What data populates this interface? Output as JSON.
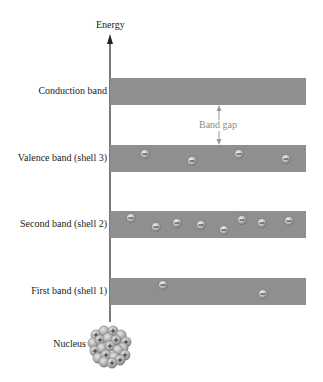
{
  "diagram": {
    "axis_label": "Energy",
    "band_gap_label": "Band gap",
    "nucleus_label": "Nucleus",
    "colors": {
      "band": "#8f8f8f",
      "axis": "#333333",
      "band_gap_arrow": "#9a9a9a",
      "band_gap_text": "#8a8a8a",
      "electron": "#b5b5b5",
      "nucleus": "#a9a9a9"
    },
    "bands": [
      {
        "name": "Conduction band",
        "top": 78,
        "electrons": []
      },
      {
        "name": "Valence band (shell 3)",
        "top": 145,
        "electrons": [
          [
            145,
            154
          ],
          [
            192,
            161
          ],
          [
            239,
            154
          ],
          [
            286,
            159
          ]
        ]
      },
      {
        "name": "Second band (shell 2)",
        "top": 211,
        "electrons": [
          [
            131,
            218
          ],
          [
            156,
            227
          ],
          [
            177,
            223
          ],
          [
            201,
            225
          ],
          [
            224,
            230
          ],
          [
            242,
            220
          ],
          [
            262,
            223
          ],
          [
            289,
            221
          ]
        ]
      },
      {
        "name": "First band (shell 1)",
        "top": 278,
        "electrons": [
          [
            163,
            285
          ],
          [
            263,
            294
          ]
        ]
      }
    ]
  }
}
